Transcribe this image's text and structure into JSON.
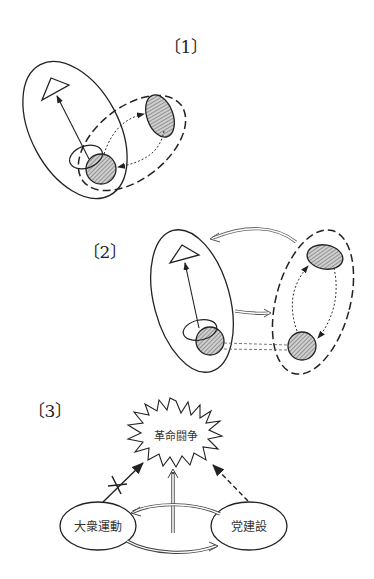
{
  "panels": [
    {
      "id": 1,
      "label": "〔1〕"
    },
    {
      "id": 2,
      "label": "〔2〕"
    },
    {
      "id": 3,
      "label": "〔3〕",
      "nodes": {
        "center": "革命闘争",
        "left": "大衆運動",
        "right": "党建設"
      }
    }
  ],
  "colors": {
    "stroke": "#222222",
    "shade": "#bdbdbd",
    "background": "#ffffff"
  }
}
